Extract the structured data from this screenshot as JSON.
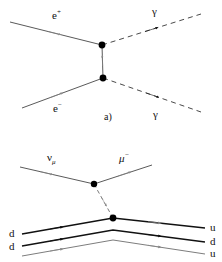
{
  "figure": {
    "background_color": "#ffffff",
    "line_color": "#555555",
    "dark_line_color": "#111111",
    "arrow_gray": "#8a8a8a",
    "arrow_black": "#111111",
    "vertex_color": "#000000",
    "width": 222,
    "height": 262
  },
  "panel_a": {
    "caption": "a)",
    "labels": {
      "positron_base": "e",
      "positron_charge": "+",
      "electron_base": "e",
      "electron_charge": "−",
      "photon_top": "γ",
      "photon_bottom": "γ"
    },
    "vertices": [
      {
        "name": "upper-vertex",
        "x": 102,
        "y": 45
      },
      {
        "name": "lower-vertex",
        "x": 103,
        "y": 78
      }
    ],
    "lines": [
      {
        "name": "positron-in",
        "style": "solid",
        "from": [
          10,
          22
        ],
        "to": [
          102,
          45
        ],
        "arrow": "gray-forward"
      },
      {
        "name": "photon-out-top",
        "style": "dashed",
        "from": [
          102,
          45
        ],
        "to": [
          201,
          14
        ],
        "arrow": "black-forward"
      },
      {
        "name": "virtual-electron",
        "style": "solid",
        "from": [
          103,
          78
        ],
        "to": [
          102,
          45
        ],
        "arrow": "gray-up"
      },
      {
        "name": "electron-in",
        "style": "solid",
        "from": [
          22,
          108
        ],
        "to": [
          103,
          78
        ],
        "arrow": "gray-forward"
      },
      {
        "name": "photon-out-bottom",
        "style": "dashed",
        "from": [
          103,
          78
        ],
        "to": [
          201,
          112
        ],
        "arrow": "black-forward"
      }
    ]
  },
  "panel_b": {
    "labels": {
      "neutrino_base": "ν",
      "neutrino_sub": "μ",
      "muon_base": "μ",
      "muon_charge": "−",
      "quark_in_top": "d",
      "quark_in_bottom": "d",
      "quark_out_top": "u",
      "quark_out_middle": "d",
      "quark_out_bottom": "u"
    },
    "vertices": [
      {
        "name": "lepton-vertex",
        "x": 94,
        "y": 184
      },
      {
        "name": "quark-vertex",
        "x": 113,
        "y": 218
      }
    ],
    "lines": [
      {
        "name": "neutrino-in",
        "style": "solid",
        "from": [
          20,
          167
        ],
        "to": [
          94,
          184
        ],
        "arrow": "gray-forward"
      },
      {
        "name": "muon-out",
        "style": "solid",
        "from": [
          94,
          184
        ],
        "to": [
          152,
          165
        ],
        "arrow": "gray-forward"
      },
      {
        "name": "w-boson",
        "style": "dashed",
        "from": [
          94,
          184
        ],
        "to": [
          113,
          218
        ],
        "arrow": "gray-down"
      },
      {
        "name": "quark-line-top",
        "style": "solid-dark",
        "from": [
          22,
          234
        ],
        "via": [
          113,
          218
        ],
        "to": [
          205,
          228
        ],
        "arrow": "black-forward"
      },
      {
        "name": "quark-line-middle",
        "style": "solid-dark",
        "from": [
          22,
          246
        ],
        "via": [
          113,
          230
        ],
        "to": [
          205,
          242
        ],
        "arrow": "black-forward"
      },
      {
        "name": "quark-line-bottom",
        "style": "solid",
        "from": [
          22,
          256
        ],
        "via": [
          113,
          240
        ],
        "to": [
          205,
          254
        ],
        "arrow": "gray-forward"
      }
    ]
  }
}
